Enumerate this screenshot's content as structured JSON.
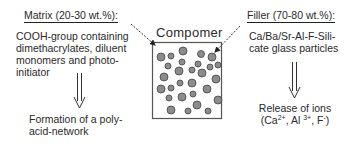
{
  "left": {
    "heading": "Matrix (20-30 wt.%):",
    "description_lines": [
      "COOH-group containing",
      "dimethacrylates, diluent",
      "monomers and photo-",
      "initiator"
    ],
    "result_lines": [
      "Formation of a poly-",
      "acid-network"
    ]
  },
  "center": {
    "title": "Compomer",
    "particles": [
      {
        "x": 161,
        "y": 57,
        "r": 4
      },
      {
        "x": 171,
        "y": 56,
        "r": 3
      },
      {
        "x": 183,
        "y": 51,
        "r": 4
      },
      {
        "x": 201,
        "y": 54,
        "r": 3.5
      },
      {
        "x": 212,
        "y": 57,
        "r": 4
      },
      {
        "x": 168,
        "y": 66,
        "r": 3
      },
      {
        "x": 182,
        "y": 62,
        "r": 3
      },
      {
        "x": 198,
        "y": 64,
        "r": 3
      },
      {
        "x": 210,
        "y": 67,
        "r": 3
      },
      {
        "x": 218,
        "y": 65,
        "r": 3
      },
      {
        "x": 179,
        "y": 71,
        "r": 4
      },
      {
        "x": 192,
        "y": 70,
        "r": 3
      },
      {
        "x": 202,
        "y": 73,
        "r": 4
      },
      {
        "x": 164,
        "y": 77,
        "r": 4
      },
      {
        "x": 192,
        "y": 83,
        "r": 4
      },
      {
        "x": 216,
        "y": 79,
        "r": 4
      },
      {
        "x": 161,
        "y": 89,
        "r": 4
      },
      {
        "x": 171,
        "y": 88,
        "r": 3
      },
      {
        "x": 180,
        "y": 83,
        "r": 3
      },
      {
        "x": 207,
        "y": 89,
        "r": 4
      },
      {
        "x": 169,
        "y": 98,
        "r": 3
      },
      {
        "x": 182,
        "y": 97,
        "r": 4
      },
      {
        "x": 193,
        "y": 94,
        "r": 3
      },
      {
        "x": 218,
        "y": 100,
        "r": 4
      },
      {
        "x": 197,
        "y": 105,
        "r": 4
      },
      {
        "x": 171,
        "y": 110,
        "r": 4
      },
      {
        "x": 188,
        "y": 111,
        "r": 3
      },
      {
        "x": 208,
        "y": 111,
        "r": 3
      }
    ],
    "particle_fill": "#8c8c8c",
    "particle_stroke": "#444444"
  },
  "right": {
    "heading": "Filler (70-80 wt.%):",
    "description_lines": [
      "Ca/Ba/Sr-Al-F-Sili-",
      "cate glass particles"
    ],
    "result_line1": "Release of ions",
    "ions": {
      "open": "(Ca",
      "ca_sup": "2+",
      "mid1": ", Al ",
      "al_sup": "3+",
      "mid2": ", F",
      "f_sup": "-",
      "close": ")"
    }
  }
}
